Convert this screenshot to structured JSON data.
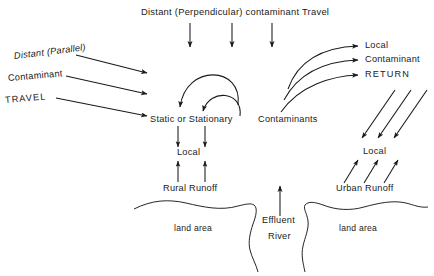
{
  "diagram": {
    "title": "Distant (Perpendicular) contaminant Travel",
    "background_color": "#ffffff",
    "stroke_color": "#1a1a1a",
    "nodes": {
      "perpendicular_travel": "Distant (Perpendicular) contaminant Travel",
      "parallel_line1": "Distant (Parallel)",
      "parallel_line2": "Contaminant",
      "parallel_line3": "TRAVEL",
      "static_or_stationary": "Static or Stationary",
      "contaminants": "Contaminants",
      "return_line1": "Local",
      "return_line2": "Contaminant",
      "return_line3": "RETURN",
      "local_left": "Local",
      "local_right": "Local",
      "rural_runoff": "Rural Runoff",
      "urban_runoff": "Urban Runoff",
      "effluent_line1": "Effluent",
      "effluent_line2": "River",
      "land_area_left": "land area",
      "land_area_right": "land area"
    }
  }
}
